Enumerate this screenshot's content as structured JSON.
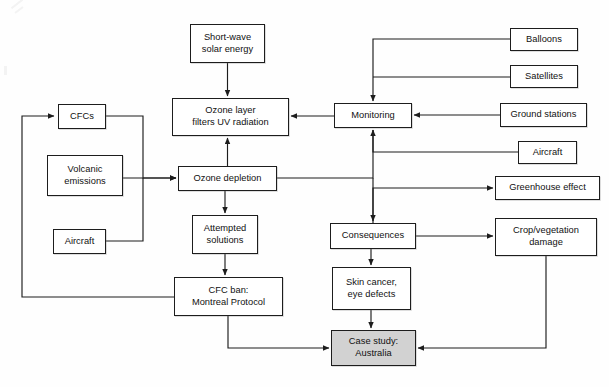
{
  "diagram": {
    "style": {
      "node_fill": "#ffffff",
      "node_fill_highlight": "#d2d2d2",
      "node_stroke": "#1d1d1d",
      "edge_stroke": "#1d1d1d",
      "background": "#fefefe"
    },
    "nodes": [
      {
        "id": "short-wave-solar-energy",
        "label": "Short-wave\nsolar energy",
        "x": 190,
        "y": 24,
        "w": 75,
        "h": 39,
        "highlight": false
      },
      {
        "id": "ozone-layer-filters-uv-radiation",
        "label": "Ozone layer\nfilters UV radiation",
        "x": 172,
        "y": 98,
        "w": 117,
        "h": 38,
        "highlight": false
      },
      {
        "id": "cfcs",
        "label": "CFCs",
        "x": 58,
        "y": 104,
        "w": 48,
        "h": 25,
        "highlight": false
      },
      {
        "id": "volcanic-emissions",
        "label": "Volcanic\nemissions",
        "x": 47,
        "y": 155,
        "w": 76,
        "h": 41,
        "highlight": false
      },
      {
        "id": "aircraft-source",
        "label": "Aircraft",
        "x": 53,
        "y": 229,
        "w": 53,
        "h": 25,
        "highlight": false
      },
      {
        "id": "ozone-depletion",
        "label": "Ozone depletion",
        "x": 178,
        "y": 166,
        "w": 99,
        "h": 25,
        "highlight": false
      },
      {
        "id": "attempted-solutions",
        "label": "Attempted\nsolutions",
        "x": 192,
        "y": 215,
        "w": 66,
        "h": 39,
        "highlight": false
      },
      {
        "id": "cfc-ban-montreal-protocol",
        "label": "CFC ban:\nMontreal Protocol",
        "x": 174,
        "y": 277,
        "w": 109,
        "h": 39,
        "highlight": false
      },
      {
        "id": "monitoring",
        "label": "Monitoring",
        "x": 334,
        "y": 103,
        "w": 78,
        "h": 25,
        "highlight": false
      },
      {
        "id": "balloons",
        "label": "Balloons",
        "x": 510,
        "y": 28,
        "w": 68,
        "h": 23,
        "highlight": false
      },
      {
        "id": "satellites",
        "label": "Satellites",
        "x": 510,
        "y": 65,
        "w": 68,
        "h": 23,
        "highlight": false
      },
      {
        "id": "ground-stations",
        "label": "Ground stations",
        "x": 500,
        "y": 103,
        "w": 87,
        "h": 24,
        "highlight": false
      },
      {
        "id": "aircraft-monitoring",
        "label": "Aircraft",
        "x": 518,
        "y": 141,
        "w": 59,
        "h": 23,
        "highlight": false
      },
      {
        "id": "consequences",
        "label": "Consequences",
        "x": 330,
        "y": 223,
        "w": 86,
        "h": 26,
        "highlight": false
      },
      {
        "id": "greenhouse-effect",
        "label": "Greenhouse effect",
        "x": 495,
        "y": 176,
        "w": 105,
        "h": 24,
        "highlight": false
      },
      {
        "id": "crop-vegetation-damage",
        "label": "Crop/vegetation\ndamage",
        "x": 495,
        "y": 218,
        "w": 102,
        "h": 38,
        "highlight": false
      },
      {
        "id": "skin-cancer-eye-defects",
        "label": "Skin cancer,\neye defects",
        "x": 332,
        "y": 267,
        "w": 79,
        "h": 43,
        "highlight": false
      },
      {
        "id": "case-study-australia",
        "label": "Case study:\nAustralia",
        "x": 331,
        "y": 330,
        "w": 85,
        "h": 36,
        "highlight": true
      }
    ],
    "edges": [
      {
        "id": "solar-to-ozone-layer",
        "from": "short-wave-solar-energy",
        "to": "ozone-layer-filters-uv-radiation",
        "path": "M227.5,63 L227.5,96",
        "arrow": true
      },
      {
        "id": "ozone-depletion-to-ozone-layer",
        "from": "ozone-depletion",
        "to": "ozone-layer-filters-uv-radiation",
        "path": "M227.5,166 L227.5,138",
        "arrow": true
      },
      {
        "id": "cfcs-to-ozone-depletion",
        "from": "cfcs",
        "to": "ozone-depletion",
        "path": "M106,116 L143,116 L143,178 L176,178",
        "arrow": true
      },
      {
        "id": "volcanic-to-ozone-depletion",
        "from": "volcanic-emissions",
        "to": "ozone-depletion",
        "path": "M123,178 L176,178",
        "arrow": true
      },
      {
        "id": "aircraft-to-ozone-depletion",
        "from": "aircraft-source",
        "to": "ozone-depletion",
        "path": "M106,241 L143,241 L143,178",
        "arrow": false
      },
      {
        "id": "ozone-depletion-to-attempted-solutions",
        "from": "ozone-depletion",
        "to": "attempted-solutions",
        "path": "M225,191 L225,213",
        "arrow": true
      },
      {
        "id": "attempted-solutions-to-cfc-ban",
        "from": "attempted-solutions",
        "to": "cfc-ban-montreal-protocol",
        "path": "M225,254 L225,275",
        "arrow": true
      },
      {
        "id": "cfc-ban-to-cfcs-feedback",
        "from": "cfc-ban-montreal-protocol",
        "to": "cfcs",
        "path": "M174,297 L22,297 L22,116 L54,116",
        "arrow": true
      },
      {
        "id": "ozone-depletion-to-monitoring",
        "from": "ozone-depletion",
        "to": "monitoring",
        "path": "M277,178 L373,178 L373,130",
        "arrow": false
      },
      {
        "id": "monitoring-to-ozone-layer",
        "from": "monitoring",
        "to": "ozone-layer-filters-uv-radiation",
        "path": "M334,116 L291,116",
        "arrow": true
      },
      {
        "id": "balloons-to-monitoring",
        "from": "balloons",
        "to": "monitoring",
        "path": "M510,39 L373,39 L373,101",
        "arrow": true
      },
      {
        "id": "satellites-to-monitoring",
        "from": "satellites",
        "to": "monitoring",
        "path": "M510,77 L373,77",
        "arrow": false
      },
      {
        "id": "ground-stations-to-monitoring",
        "from": "ground-stations",
        "to": "monitoring",
        "path": "M500,115 L414,115",
        "arrow": true
      },
      {
        "id": "aircraft-monitoring-to-monitoring",
        "from": "aircraft-monitoring",
        "to": "monitoring",
        "path": "M518,152 L373,152 L373,130",
        "arrow": true
      },
      {
        "id": "ozone-depletion-to-consequences",
        "from": "ozone-depletion",
        "to": "consequences",
        "path": "M373,178 L373,221",
        "arrow": true
      },
      {
        "id": "consequences-to-greenhouse-effect",
        "from": "consequences",
        "to": "greenhouse-effect",
        "path": "M373,223 L373,188 L493,188",
        "arrow": true
      },
      {
        "id": "consequences-to-crop-damage",
        "from": "consequences",
        "to": "crop-vegetation-damage",
        "path": "M416,236 L493,236",
        "arrow": true
      },
      {
        "id": "consequences-to-skin-cancer",
        "from": "consequences",
        "to": "skin-cancer-eye-defects",
        "path": "M371,249 L371,265",
        "arrow": true
      },
      {
        "id": "skin-cancer-to-case-study",
        "from": "skin-cancer-eye-defects",
        "to": "case-study-australia",
        "path": "M371,310 L371,328",
        "arrow": true
      },
      {
        "id": "crop-damage-to-case-study",
        "from": "crop-vegetation-damage",
        "to": "case-study-australia",
        "path": "M546,256 L546,348 L418,348",
        "arrow": true
      },
      {
        "id": "cfc-ban-to-case-study",
        "from": "cfc-ban-montreal-protocol",
        "to": "case-study-australia",
        "path": "M228,316 L228,348 L329,348",
        "arrow": true
      }
    ]
  }
}
